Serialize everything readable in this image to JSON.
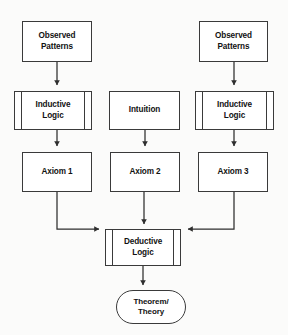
{
  "diagram": {
    "background_color": "#fbfbfa",
    "line_color": "#3a3a3a",
    "node_fill": "#ffffff",
    "text_color": "#121212",
    "nodes": [
      {
        "id": "observed_patterns_left",
        "label": "Observed\nPatterns",
        "shape": "rectangle",
        "x": 22,
        "y": 21,
        "w": 70,
        "h": 41
      },
      {
        "id": "observed_patterns_right",
        "label": "Observed\nPatterns",
        "shape": "rectangle",
        "x": 199,
        "y": 21,
        "w": 69,
        "h": 41
      },
      {
        "id": "inductive_logic_left",
        "label": "Inductive\nLogic",
        "shape": "predefined-process",
        "x": 14,
        "y": 91,
        "w": 78,
        "h": 39
      },
      {
        "id": "intuition",
        "label": "Intuition",
        "shape": "rectangle",
        "x": 109,
        "y": 91,
        "w": 71,
        "h": 39
      },
      {
        "id": "inductive_logic_right",
        "label": "Inductive\nLogic",
        "shape": "predefined-process",
        "x": 195,
        "y": 91,
        "w": 79,
        "h": 39
      },
      {
        "id": "axiom_1",
        "label": "Axiom 1",
        "shape": "rectangle",
        "x": 22,
        "y": 152,
        "w": 70,
        "h": 40
      },
      {
        "id": "axiom_2",
        "label": "Axiom 2",
        "shape": "rectangle",
        "x": 110,
        "y": 152,
        "w": 70,
        "h": 40
      },
      {
        "id": "axiom_3",
        "label": "Axiom 3",
        "shape": "rectangle",
        "x": 198,
        "y": 152,
        "w": 70,
        "h": 40
      },
      {
        "id": "deductive_logic",
        "label": "Deductive\nLogic",
        "shape": "predefined-process",
        "x": 105,
        "y": 229,
        "w": 76,
        "h": 37
      },
      {
        "id": "theorem_theory",
        "label": "Theorem/\nTheory",
        "shape": "terminator",
        "x": 116,
        "y": 290,
        "w": 70,
        "h": 34
      }
    ],
    "edges": [
      {
        "from": "observed_patterns_left",
        "to": "inductive_logic_left",
        "type": "straight-down"
      },
      {
        "from": "observed_patterns_right",
        "to": "inductive_logic_right",
        "type": "straight-down"
      },
      {
        "from": "inductive_logic_left",
        "to": "axiom_1",
        "type": "straight-down"
      },
      {
        "from": "intuition",
        "to": "axiom_2",
        "type": "straight-down"
      },
      {
        "from": "inductive_logic_right",
        "to": "axiom_3",
        "type": "straight-down"
      },
      {
        "from": "axiom_1",
        "to": "deductive_logic",
        "type": "elbow-right"
      },
      {
        "from": "axiom_2",
        "to": "deductive_logic",
        "type": "straight-down"
      },
      {
        "from": "axiom_3",
        "to": "deductive_logic",
        "type": "elbow-left"
      },
      {
        "from": "deductive_logic",
        "to": "theorem_theory",
        "type": "straight-down"
      }
    ]
  }
}
